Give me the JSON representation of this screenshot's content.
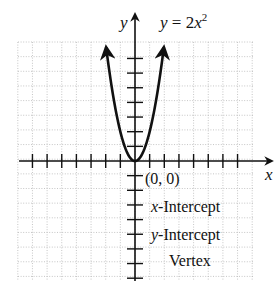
{
  "chart_data": {
    "type": "line",
    "equation_label": {
      "lhs": "y = 2",
      "var": "x",
      "exp": "2"
    },
    "xlabel": "x",
    "ylabel": "y",
    "xlim": [
      -8,
      8
    ],
    "ylim": [
      -8,
      8
    ],
    "grid": true,
    "grid_style": "dotted",
    "x_ticks_left": [
      -7,
      -6,
      -5,
      -4,
      -3,
      -2,
      -1
    ],
    "x_ticks_right": [
      1,
      2,
      3,
      4,
      5,
      6,
      7
    ],
    "y_ticks_up": [
      1,
      2,
      3,
      4,
      5,
      6,
      7
    ],
    "y_ticks_down": [
      -1,
      -2,
      -3,
      -4,
      -5,
      -6,
      -7,
      -8
    ],
    "series": [
      {
        "name": "y = 2x^2",
        "x": [
          -2,
          -1.5,
          -1,
          -0.5,
          0,
          0.5,
          1,
          1.5,
          2
        ],
        "y": [
          8,
          4.5,
          2,
          0.5,
          0,
          0.5,
          2,
          4.5,
          8
        ],
        "arrows_at_ends": true
      }
    ],
    "annotations": [
      {
        "text": "(0, 0)",
        "at": [
          0,
          0
        ]
      },
      {
        "text_var": "x",
        "text": "-Intercept"
      },
      {
        "text_var": "y",
        "text": "-Intercept"
      },
      {
        "text": "Vertex"
      }
    ]
  },
  "labels": {
    "x_axis": "x",
    "y_axis": "y",
    "eq_lhs": "y = 2",
    "eq_var": "x",
    "eq_exp": "2",
    "point": "(0, 0)",
    "x_int_var": "x",
    "x_int_rest": "-Intercept",
    "y_int_var": "y",
    "y_int_rest": "-Intercept",
    "vertex": "Vertex"
  },
  "colors": {
    "axis": "#111111",
    "curve": "#111111",
    "grid": "#b8b8b8"
  }
}
